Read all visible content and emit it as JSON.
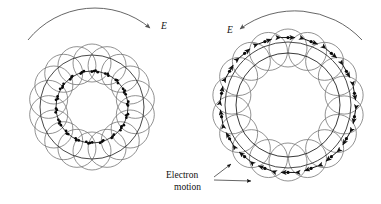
{
  "figure": {
    "title_visible": false,
    "background_color": "#ffffff",
    "stroke_color": "#111111",
    "line_color_light": "#5a5a5a",
    "width": 381,
    "height": 204
  },
  "panels": [
    {
      "id": "left-panel",
      "name": "bunched-electron-ring",
      "center_x": 92,
      "center_y": 107,
      "outer_radius": 52,
      "inner_radius": 36,
      "orbit_circle_count": 18,
      "orbit_circle_radius": 19,
      "orbit_circle_center_radius": 44,
      "electron_dot_count": 60,
      "electron_dot_radius": 36,
      "field_label": "E",
      "field_label_x": 161,
      "field_label_y": 29,
      "field_arc_direction": "clockwise"
    },
    {
      "id": "right-panel",
      "name": "phase-bunched-electron-ring",
      "center_x": 288,
      "center_y": 105,
      "outer_radius": 63,
      "inner_radius": 52,
      "orbit_circle_count": 18,
      "orbit_circle_radius": 19,
      "orbit_circle_center_radius": 57,
      "electron_dot_count": 18,
      "field_label": "E",
      "field_label_x": 227,
      "field_label_y": 33,
      "field_arc_direction": "counterclockwise",
      "arrow_style": "double-headed-tangential"
    }
  ],
  "annotations": [
    {
      "id": "electron-motion-label",
      "line1": "Electron",
      "line2": "motion",
      "x": 166,
      "y": 177,
      "leader_targets": [
        {
          "x": 233,
          "y": 163
        },
        {
          "x": 253,
          "y": 181
        }
      ]
    }
  ]
}
